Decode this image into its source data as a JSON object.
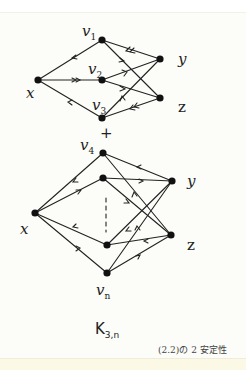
{
  "diagram": {
    "top_graph": {
      "labels": {
        "v1": "v",
        "v1_sub": "1",
        "v2": "v",
        "v2_sub": "2",
        "v3": "v",
        "v3_sub": "3",
        "x": "x",
        "y": "y",
        "z": "z"
      }
    },
    "plus": "+",
    "bottom_graph": {
      "labels": {
        "v4": "v",
        "v4_sub": "4",
        "vn": "v",
        "vn_sub": "n",
        "x": "x",
        "y": "y",
        "z": "z"
      }
    },
    "graph_name": "K",
    "graph_name_sub": "3,n",
    "caption": "(2.2)の 2 安定性",
    "colors": {
      "ink": "#222222",
      "background": "#fcfcf9"
    }
  }
}
